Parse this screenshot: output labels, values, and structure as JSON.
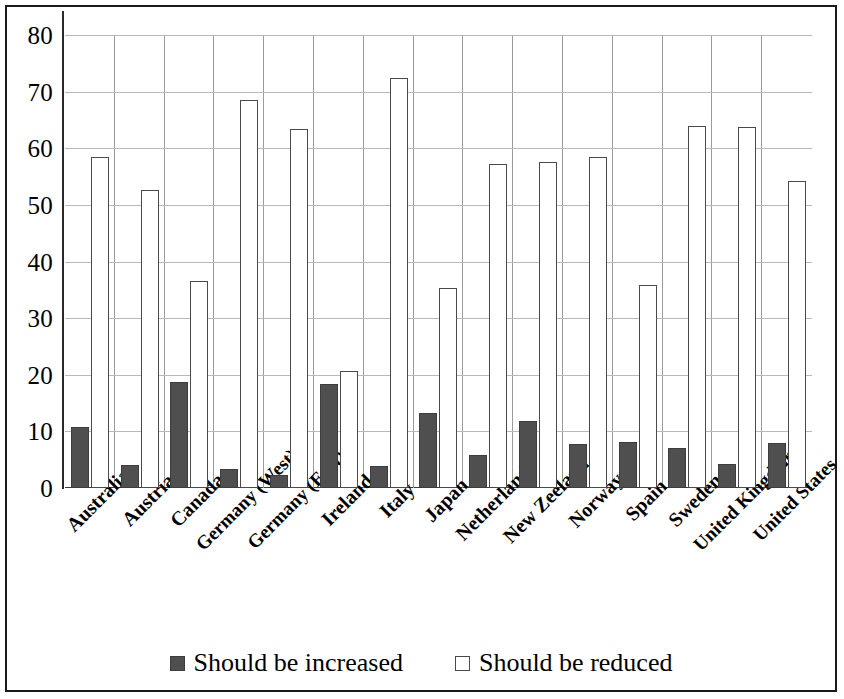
{
  "chart_data": {
    "type": "bar",
    "title": "",
    "xlabel": "",
    "ylabel": "",
    "ylim": [
      0,
      80
    ],
    "ytick_step": 10,
    "yticks": [
      "0",
      "10",
      "20",
      "30",
      "40",
      "50",
      "60",
      "70",
      "80"
    ],
    "grid": true,
    "legend_position": "bottom",
    "categories": [
      "Australia",
      "Austria",
      "Canada",
      "Germany (West)",
      "Germany (East)",
      "Ireland",
      "Italy",
      "Japan",
      "Netherlands",
      "New Zeeland",
      "Norway",
      "Spain",
      "Sweden",
      "United Kingdom",
      "United States"
    ],
    "series": [
      {
        "name": "Should be increased",
        "color": "#4f4f4f",
        "values": [
          10.8,
          4.0,
          18.8,
          3.3,
          2.3,
          18.3,
          3.9,
          13.3,
          5.8,
          11.8,
          7.7,
          8.1,
          7.1,
          4.3,
          7.9
        ]
      },
      {
        "name": "Should be reduced",
        "color": "#ffffff",
        "values": [
          58.4,
          52.6,
          36.6,
          68.5,
          63.4,
          20.6,
          72.4,
          35.4,
          57.2,
          57.6,
          58.5,
          35.9,
          64.0,
          63.7,
          54.2
        ]
      }
    ]
  },
  "legend": {
    "items": [
      {
        "label": "Should be increased",
        "swatch": "filled-square-icon"
      },
      {
        "label": "Should be reduced",
        "swatch": "empty-square-icon"
      }
    ]
  }
}
